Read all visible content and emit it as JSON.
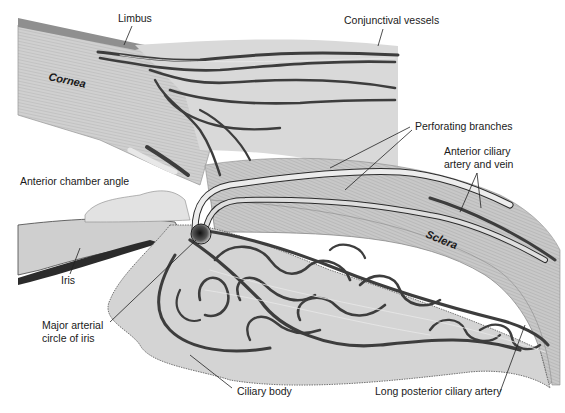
{
  "figure": {
    "colors": {
      "tissue_light": "#d6d6d6",
      "cornea": "#cfcfcf",
      "sclera": "#c4c4c4",
      "conjunctiva_band": "#9a9a9a",
      "vessel_dark": "#3d3d3d",
      "vessel_highlight": "#e8e8e8",
      "background": "#ffffff",
      "label_text": "#1a1a1a"
    }
  },
  "labels": {
    "limbus": "Limbus",
    "conjunctival_vessels": "Conjunctival vessels",
    "cornea": "Cornea",
    "perforating_branches": "Perforating branches",
    "anterior_ciliary": [
      "Anterior ciliary",
      "artery and vein"
    ],
    "anterior_chamber_angle": "Anterior chamber angle",
    "sclera": "Sclera",
    "iris": "Iris",
    "major_arterial_circle": [
      "Major arterial",
      "circle of iris"
    ],
    "ciliary_body": "Ciliary body",
    "long_posterior_ciliary_artery": "Long posterior ciliary artery"
  }
}
